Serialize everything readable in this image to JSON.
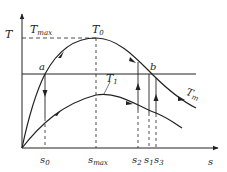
{
  "diagram": {
    "axes": {
      "y_label": "T",
      "x_label": "s"
    },
    "labels": {
      "t_max": "T",
      "t_max_sub": "max",
      "t_zero": "T",
      "t_zero_sub": "0",
      "t_one": "T",
      "t_one_sub": "1",
      "t_m": "T",
      "t_m_sub": "m",
      "point_a": "a",
      "point_b": "b"
    },
    "ticks": {
      "s0": "s",
      "s0_sub": "0",
      "smax": "s",
      "smax_sub": "max",
      "s2": "s",
      "s2_sub": "2",
      "s1": "s",
      "s1_sub": "1",
      "s3": "s",
      "s3_sub": "3"
    },
    "colors": {
      "stroke": "#222222",
      "background": "#ffffff"
    }
  }
}
